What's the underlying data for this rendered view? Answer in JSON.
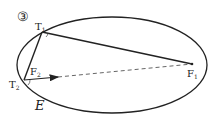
{
  "diagram": {
    "panel_label": "③",
    "ellipse_label": "E",
    "points": {
      "T1": {
        "label": "T",
        "sub": "1"
      },
      "T2": {
        "label": "T",
        "sub": "2"
      },
      "F1": {
        "label": "F",
        "sub": "1"
      },
      "F2": {
        "label": "F",
        "sub": "2"
      }
    },
    "colors": {
      "stroke": "#222222",
      "dashed": "#666666",
      "panel_label": "#888888"
    }
  }
}
